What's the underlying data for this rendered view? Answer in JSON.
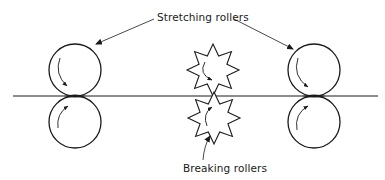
{
  "diagram": {
    "labels": {
      "stretching": "Stretching rollers",
      "breaking": "Breaking rollers"
    },
    "colors": {
      "stroke": "#1a1a1a",
      "background": "#ffffff"
    },
    "components": [
      {
        "id": "left-top-roller",
        "type": "circle-roller",
        "role": "stretching"
      },
      {
        "id": "left-bottom-roller",
        "type": "circle-roller",
        "role": "stretching"
      },
      {
        "id": "top-breaking-roller",
        "type": "star-roller",
        "role": "breaking"
      },
      {
        "id": "bottom-breaking-roller",
        "type": "star-roller",
        "role": "breaking"
      },
      {
        "id": "right-top-roller",
        "type": "circle-roller",
        "role": "stretching"
      },
      {
        "id": "right-bottom-roller",
        "type": "circle-roller",
        "role": "stretching"
      },
      {
        "id": "material-line",
        "type": "line",
        "role": "fiber-strand"
      }
    ]
  }
}
